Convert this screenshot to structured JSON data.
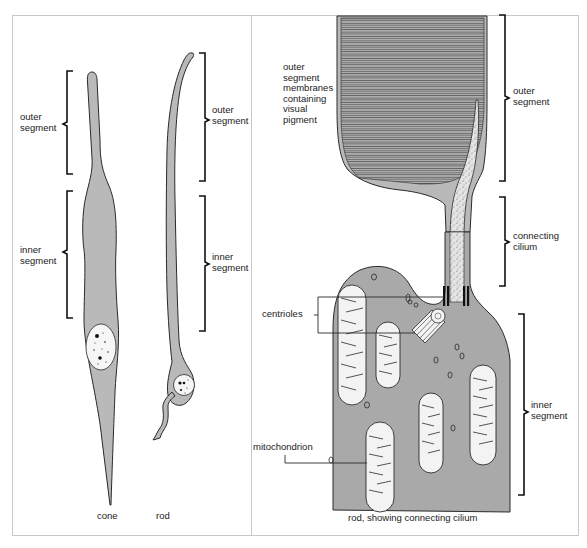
{
  "figure": {
    "colors": {
      "cell_fill": "#b9b9b9",
      "inner_fill": "#a9a9a9",
      "outline": "#2a2a2a",
      "frame": "#c8c8c8",
      "background": "#ffffff"
    },
    "left_panel": {
      "cone": {
        "caption": "cone",
        "outer_segment_label": "outer\nsegment",
        "inner_segment_label": "inner\nsegment"
      },
      "rod": {
        "caption": "rod",
        "outer_segment_label": "outer\nsegment",
        "inner_segment_label": "inner\nsegment"
      }
    },
    "right_panel": {
      "caption": "rod, showing connecting cilium",
      "membranes_label": "outer\nsegment\nmembranes\ncontaining\nvisual\npigment",
      "outer_segment_label": "outer\nsegment",
      "connecting_cilium_label": "connecting\ncilium",
      "inner_segment_label": "inner\nsegment",
      "centrioles_label": "centrioles",
      "mitochondrion_label": "mitochondrion"
    }
  }
}
